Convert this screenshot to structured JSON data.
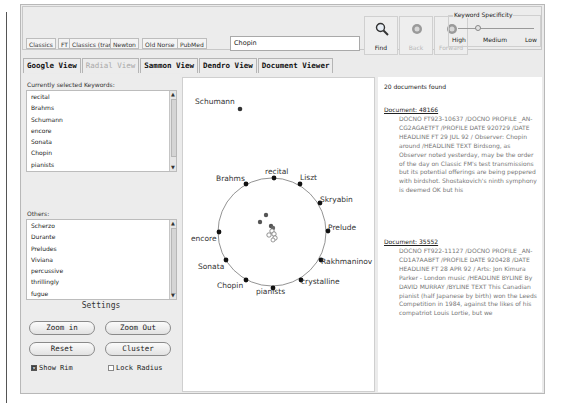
{
  "toolbar": {
    "corpora": [
      "Classics",
      "FT",
      "Classics (trans.)",
      "Newton",
      "Old Norse",
      "PubMed"
    ],
    "search_value": "Chopin",
    "find_label": "Find",
    "back_label": "Back",
    "forward_label": "Forward",
    "keyword_specificity": {
      "title": "Keyword Specificity",
      "ticks": [
        "High",
        "Medium",
        "Low"
      ]
    }
  },
  "tabs": [
    {
      "label": "Google View",
      "active": false
    },
    {
      "label": "Radial View",
      "active": true
    },
    {
      "label": "Sammon View",
      "active": false
    },
    {
      "label": "Dendro View",
      "active": false
    },
    {
      "label": "Document Viewer",
      "active": false
    }
  ],
  "left": {
    "selected_label": "Currently selected Keywords:",
    "selected": [
      "recital",
      "Brahms",
      "Schumann",
      "encore",
      "Sonata",
      "Chopin",
      "pianists"
    ],
    "others_label": "Others:",
    "others": [
      "Scherzo",
      "Durante",
      "Preludes",
      "Viviana",
      "percussive",
      "thrillingly",
      "fugue"
    ],
    "settings_title": "Settings",
    "buttons": {
      "zoom_in": "Zoom in",
      "zoom_out": "Zoom Out",
      "reset": "Reset",
      "cluster": "Cluster"
    },
    "show_rim": {
      "label": "Show Rim",
      "checked": true
    },
    "lock_radius": {
      "label": "Lock Radius",
      "checked": false
    }
  },
  "radial": {
    "outlier": {
      "label": "Schumann"
    },
    "rim_keywords": [
      "recital",
      "Liszt",
      "Skryabin",
      "Prelude",
      "Rakhmaninov",
      "crystalline",
      "pianists",
      "Chopin",
      "Sonata",
      "encore",
      "Brahms"
    ]
  },
  "documents": {
    "count_text": "20 documents found",
    "items": [
      {
        "title": "Document: 48166",
        "body": "DOCNO FT923-10637 /DOCNO PROFILE _AN-CG2AGAETFT /PROFILE DATE 920729 /DATE HEADLINE FT 29 JUL 92 / Observer: Chopin around /HEADLINE TEXT Birdsong, as Observer noted yesterday, may be the order of the day on Classic FM's test transmissions but its potential offerings are being peppered with birdshot. Shostakovich's ninth symphony is deemed OK but his"
      },
      {
        "title": "Document: 35552",
        "body": "DOCNO FT922-11127 /DOCNO PROFILE _AN-CD1A7AABFT /PROFILE DATE 920428 /DATE HEADLINE FT 28 APR 92 / Arts: Jon Kimura Parker - London music /HEADLINE BYLINE By DAVID MURRAY /BYLINE TEXT This Canadian pianist (half Japanese by birth) won the Leeds Competition in 1984, against the likes of his compatriot Louis Lortie, but we"
      }
    ]
  }
}
